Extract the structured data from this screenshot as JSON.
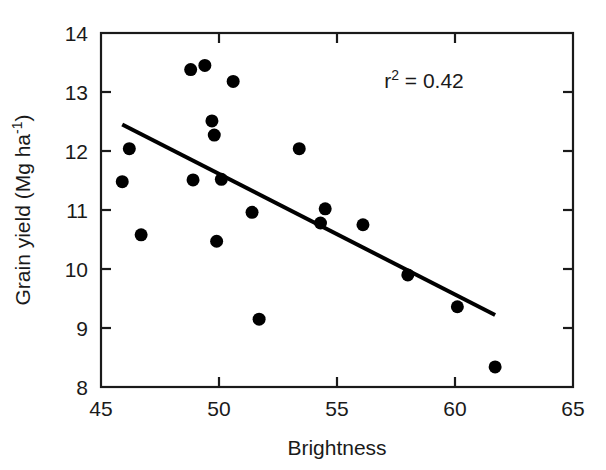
{
  "chart_data": {
    "type": "scatter",
    "title": "",
    "xlabel": "Brightness",
    "ylabel": "Grain yield (Mg ha-1)",
    "ylabel_parts": {
      "main": "Grain yield (Mg ha",
      "exponent": "-1",
      "tail": ")"
    },
    "xlim": [
      45,
      65
    ],
    "ylim": [
      8,
      14
    ],
    "xticks": [
      45,
      50,
      55,
      60,
      65
    ],
    "yticks": [
      8,
      9,
      10,
      11,
      12,
      13,
      14
    ],
    "xtick_labels": [
      "45",
      "50",
      "55",
      "60",
      "65"
    ],
    "ytick_labels": [
      "8",
      "9",
      "10",
      "11",
      "12",
      "13",
      "14"
    ],
    "grid": false,
    "legend": false,
    "marker": "filled-circle",
    "marker_color": "#000000",
    "marker_size_px": 13,
    "points": [
      {
        "x": 45.9,
        "y": 11.48
      },
      {
        "x": 46.2,
        "y": 12.04
      },
      {
        "x": 46.7,
        "y": 10.58
      },
      {
        "x": 48.8,
        "y": 13.38
      },
      {
        "x": 48.9,
        "y": 11.51
      },
      {
        "x": 49.4,
        "y": 13.45
      },
      {
        "x": 49.7,
        "y": 12.51
      },
      {
        "x": 49.8,
        "y": 12.27
      },
      {
        "x": 49.9,
        "y": 10.47
      },
      {
        "x": 50.1,
        "y": 11.52
      },
      {
        "x": 50.6,
        "y": 13.18
      },
      {
        "x": 51.4,
        "y": 10.96
      },
      {
        "x": 51.7,
        "y": 9.15
      },
      {
        "x": 53.4,
        "y": 12.04
      },
      {
        "x": 54.3,
        "y": 10.78
      },
      {
        "x": 54.5,
        "y": 11.02
      },
      {
        "x": 56.1,
        "y": 10.75
      },
      {
        "x": 58.0,
        "y": 9.9
      },
      {
        "x": 60.1,
        "y": 9.36
      },
      {
        "x": 61.7,
        "y": 8.34
      }
    ],
    "trendline": {
      "type": "linear",
      "x_start": 45.9,
      "y_start": 12.45,
      "x_end": 61.7,
      "y_end": 9.22,
      "color": "#000000",
      "width_px": 4
    },
    "annotations": [
      {
        "name": "r-squared",
        "text": "r2 = 0.42",
        "parts": {
          "base": "r",
          "exponent": "2",
          "rest": " = 0.42"
        },
        "x": 57.0,
        "y": 13.06
      }
    ]
  },
  "colors": {
    "axis": "#1a1a1a",
    "marker": "#000000",
    "trendline": "#000000",
    "background": "#ffffff"
  }
}
